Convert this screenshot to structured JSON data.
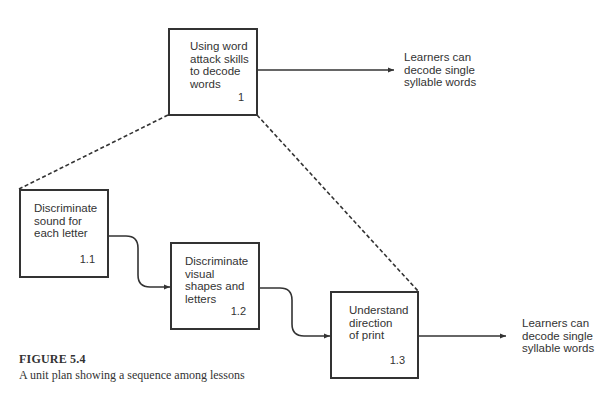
{
  "diagram": {
    "type": "unit-plan-hierarchy",
    "nodes": [
      {
        "id": "1",
        "label": "Using word\nattack skills\nto decode\nwords",
        "number": "1"
      },
      {
        "id": "1.1",
        "label": "Discriminate\nsound for\neach letter",
        "number": "1.1"
      },
      {
        "id": "1.2",
        "label": "Discriminate\nvisual\nshapes and\nletters",
        "number": "1.2"
      },
      {
        "id": "1.3",
        "label": "Understand\ndirection\nof print",
        "number": "1.3"
      }
    ],
    "outcomes": [
      {
        "from": "1",
        "text": "Learners can\ndecode single\nsyllable words"
      },
      {
        "from": "1.3",
        "text": "Learners can\ndecode single\nsyllable words"
      }
    ],
    "edges": [
      {
        "from": "1",
        "to": "1.1",
        "style": "dashed",
        "meaning": "decomposition"
      },
      {
        "from": "1",
        "to": "1.3",
        "style": "dashed",
        "meaning": "decomposition"
      },
      {
        "from": "1.1",
        "to": "1.2",
        "style": "solid-arrow",
        "meaning": "sequence"
      },
      {
        "from": "1.2",
        "to": "1.3",
        "style": "solid-arrow",
        "meaning": "sequence"
      },
      {
        "from": "1",
        "to": "outcome-top",
        "style": "solid-arrow"
      },
      {
        "from": "1.3",
        "to": "outcome-bottom",
        "style": "solid-arrow"
      }
    ]
  },
  "caption": {
    "title": "FIGURE 5.4",
    "text": "A unit plan showing a sequence among lessons"
  },
  "colors": {
    "line": "#333333",
    "text": "#333333",
    "background": "#ffffff"
  }
}
